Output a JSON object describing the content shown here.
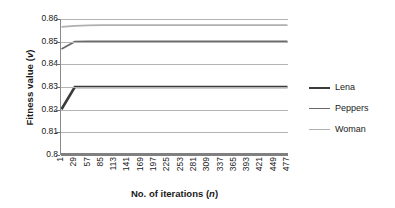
{
  "chart_data": {
    "type": "line",
    "title": "",
    "xlabel": "No. of iterations (n)",
    "xlabel_plain": "No. of iterations (",
    "xlabel_italic": "n",
    "xlabel_tail": ")",
    "ylabel": "Fitness value (v)",
    "ylabel_plain": "Fitness value (",
    "ylabel_italic": "v",
    "ylabel_tail": ")",
    "grid": true,
    "legend_position": "right",
    "ylim": [
      0.8,
      0.86
    ],
    "yticks": [
      "0.86",
      "0.85",
      "0.84",
      "0.83",
      "0.82",
      "0.81",
      "0.8"
    ],
    "ytick_values": [
      0.86,
      0.85,
      0.84,
      0.83,
      0.82,
      0.81,
      0.8
    ],
    "xticks": [
      "1",
      "29",
      "57",
      "85",
      "113",
      "141",
      "169",
      "197",
      "225",
      "253",
      "281",
      "309",
      "337",
      "365",
      "393",
      "421",
      "449",
      "477"
    ],
    "x": [
      1,
      29,
      57,
      85,
      113,
      141,
      169,
      197,
      225,
      253,
      281,
      309,
      337,
      365,
      393,
      421,
      449,
      477
    ],
    "series": [
      {
        "name": "Lena",
        "color": "#3b3b3b",
        "width": 2.6,
        "values": [
          0.8202,
          0.83,
          0.83,
          0.83,
          0.83,
          0.83,
          0.83,
          0.83,
          0.83,
          0.83,
          0.83,
          0.83,
          0.83,
          0.83,
          0.83,
          0.83,
          0.83,
          0.83
        ]
      },
      {
        "name": "Peppers",
        "color": "#6b6b6b",
        "width": 1.8,
        "values": [
          0.8468,
          0.85,
          0.8501,
          0.8501,
          0.8501,
          0.8501,
          0.8501,
          0.8501,
          0.8501,
          0.8501,
          0.8501,
          0.8501,
          0.8501,
          0.8501,
          0.8501,
          0.8501,
          0.8501,
          0.8501
        ]
      },
      {
        "name": "Woman",
        "color": "#b0b0b0",
        "width": 1.7,
        "values": [
          0.8565,
          0.857,
          0.8572,
          0.8573,
          0.8573,
          0.8573,
          0.8573,
          0.8573,
          0.8573,
          0.8573,
          0.8573,
          0.8573,
          0.8573,
          0.8573,
          0.8573,
          0.8573,
          0.8573,
          0.8573
        ]
      }
    ]
  },
  "legend": {
    "items": [
      {
        "label": "Lena",
        "color": "#3b3b3b"
      },
      {
        "label": "Peppers",
        "color": "#6b6b6b"
      },
      {
        "label": "Woman",
        "color": "#b0b0b0"
      }
    ]
  }
}
